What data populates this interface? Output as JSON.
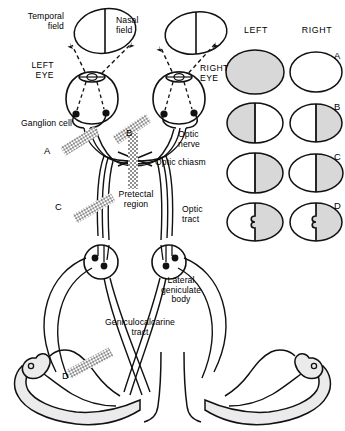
{
  "fields": {
    "temporal_label": "Temporal\nfield",
    "nasal_label": "Nasal\nfield"
  },
  "eyes": {
    "left": "LEFT\nEYE",
    "right": "RIGHT\nEYE"
  },
  "labels": {
    "ganglion_cell": "Ganglion cell",
    "optic_nerve": "Optic\nnerve",
    "optic_chiasm": "Optic chiasm",
    "pretectal_region": "Pretectal\nregion",
    "optic_tract": "Optic\ntract",
    "lateral_geniculate_body": "Lateral\ngeniculate\nbody",
    "geniculocalcarine_tract": "Geniculocalcarine\ntract"
  },
  "lesions": [
    {
      "id": "A",
      "name": "optic-nerve-lesion"
    },
    {
      "id": "B",
      "name": "optic-chiasm-lesion"
    },
    {
      "id": "C",
      "name": "optic-tract-lesion"
    },
    {
      "id": "D",
      "name": "geniculocalcarine-tract-lesion"
    }
  ],
  "legend": {
    "left_header": "LEFT",
    "right_header": "RIGHT",
    "rows": [
      {
        "id": "A",
        "left_fill": "full",
        "right_fill": "none",
        "midline": false,
        "notch": false
      },
      {
        "id": "B",
        "left_fill": "left-half",
        "right_fill": "right-half",
        "midline": true,
        "notch": false
      },
      {
        "id": "C",
        "left_fill": "right-half",
        "right_fill": "right-half",
        "midline": true,
        "notch": false
      },
      {
        "id": "D",
        "left_fill": "right-half",
        "right_fill": "right-half",
        "midline": true,
        "notch": true
      }
    ]
  },
  "colors": {
    "ink": "#111111",
    "shade": "#d8d8d8",
    "cortex": "#ebebeb",
    "hatch": "#9a9a9a"
  }
}
